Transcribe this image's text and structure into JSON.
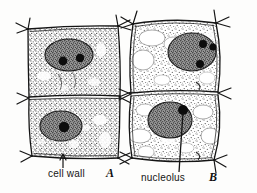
{
  "figure": {
    "background_color": "#fdfdfc",
    "ink_color": "#1a1a1a",
    "stipple_color": "#3a3a3a",
    "nucleus_fill": "#6b6b6b",
    "nucleolus_fill": "#0d0d0d",
    "vacuole_fill": "#ffffff"
  },
  "labels": {
    "cell_wall": "cell wall",
    "nucleolus": "nucleolus"
  },
  "panels": [
    {
      "letter": "A",
      "description": "Young meristematic cells with dense cytoplasm and no large vacuoles",
      "cells": [
        {
          "position": "upper",
          "nucleoli_count": 2,
          "vacuoles_count": 0
        },
        {
          "position": "lower",
          "nucleoli_count": 1,
          "vacuoles_count": 0
        }
      ]
    },
    {
      "letter": "B",
      "description": "Older enlarged cells with numerous vacuoles in the cytoplasm",
      "cells": [
        {
          "position": "upper",
          "nucleoli_count": 3,
          "vacuoles_count": 5
        },
        {
          "position": "lower",
          "nucleoli_count": 1,
          "vacuoles_count": 7
        }
      ]
    }
  ],
  "annotations": [
    {
      "name": "cell-wall-pointer",
      "style": "arrow",
      "label": "cell wall",
      "points_to": "outer wall of lower cell in panel A"
    },
    {
      "name": "nucleolus-pointer",
      "style": "line",
      "label": "nucleolus",
      "points_to": "dark nucleolus inside nucleus of lower cell in panel B"
    }
  ]
}
